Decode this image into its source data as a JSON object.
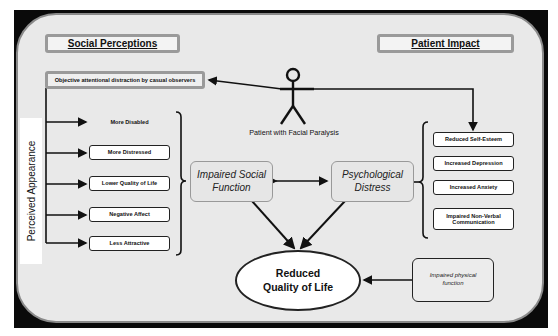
{
  "diagram": {
    "headers": {
      "left": "Social Perceptions",
      "right": "Patient Impact"
    },
    "observer_box": "Objective attentional distraction by casual observers",
    "patient_caption": "Patient with Facial Paralysis",
    "perceived_axis_label": "Perceived Appearance",
    "perceptions": [
      {
        "label": "More Disabled",
        "boxed": false
      },
      {
        "label": "More Distressed",
        "boxed": true
      },
      {
        "label": "Lower Quality of Life",
        "boxed": true
      },
      {
        "label": "Negative Affect",
        "boxed": true
      },
      {
        "label": "Less Attractive",
        "boxed": true
      }
    ],
    "center": {
      "social": "Impaired Social Function",
      "psych": "Psychological Distress",
      "outcome_line1": "Reduced",
      "outcome_line2": "Quality of Life"
    },
    "impacts": [
      "Reduced Self-Esteem",
      "Increased Depression",
      "Increased Anxiety",
      "Impaired Non-Verbal Communication"
    ],
    "physical": "Impaired physical function",
    "colors": {
      "frame": "#0a0a0a",
      "panel": "#e9e9e9",
      "header_border": "#9a9a9a",
      "line": "#111111"
    }
  }
}
